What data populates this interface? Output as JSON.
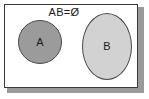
{
  "figure": {
    "caption": "AB=Ø",
    "background_color": "#ffffff",
    "frame_border_color": "#3a3a3a",
    "shadow_color": "#9a9a9a"
  },
  "sets": [
    {
      "id": "A",
      "label": "A",
      "shape": "circle",
      "fill_color": "#9b9b9b",
      "stroke_color": "#4a4a4a"
    },
    {
      "id": "B",
      "label": "B",
      "shape": "ellipse",
      "fill_color": "#d2d2d2",
      "stroke_color": "#4a4a4a"
    }
  ],
  "chart_data": {
    "type": "diagram",
    "diagram_kind": "venn",
    "title": "AB=Ø",
    "relation": "disjoint",
    "sets": [
      "A",
      "B"
    ],
    "intersection": "Ø",
    "overlap": false
  }
}
